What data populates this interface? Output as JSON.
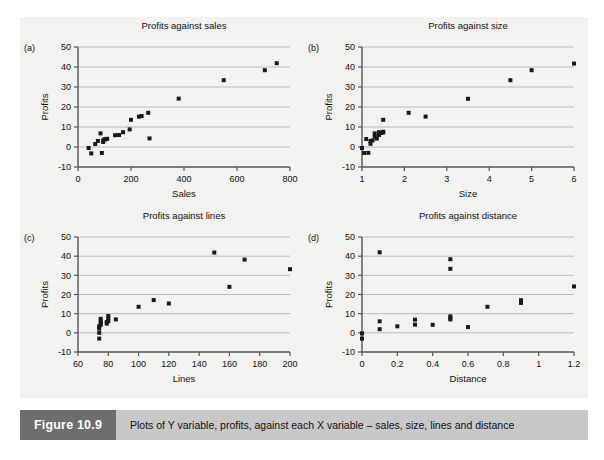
{
  "figure": {
    "caption_tag": "Figure 10.9",
    "caption_text": "Plots of Y variable, profits, against each X variable – sales, size, lines and distance",
    "panel_background": "#f2f2f0",
    "caption_bar_color": "#c8c8c8",
    "caption_tag_color": "#6e6e6e",
    "marker_color": "#1a1a1a",
    "axis_color": "#555555",
    "grid_color": "#b4b4b4"
  },
  "chart_data": [
    {
      "type": "scatter",
      "panel_label": "(a)",
      "title": "Profits against sales",
      "xlabel": "Sales",
      "ylabel": "Profits",
      "xlim": [
        0,
        800
      ],
      "ylim": [
        -10,
        50
      ],
      "xticks": [
        0,
        200,
        400,
        600,
        800
      ],
      "yticks": [
        -10,
        0,
        10,
        20,
        30,
        40,
        50
      ],
      "grid": "horizontal",
      "legend": "none",
      "x": [
        40,
        50,
        65,
        75,
        85,
        90,
        95,
        95,
        100,
        105,
        110,
        140,
        155,
        170,
        195,
        200,
        230,
        240,
        265,
        270,
        380,
        550,
        705,
        750
      ],
      "y": [
        -0.5,
        -3.2,
        1.5,
        3.0,
        6.8,
        -3.0,
        2.5,
        3.3,
        3.8,
        3.9,
        4.1,
        5.9,
        6.0,
        7.4,
        8.8,
        13.6,
        15.2,
        15.5,
        17.1,
        4.3,
        24.2,
        33.4,
        38.4,
        41.9
      ]
    },
    {
      "type": "scatter",
      "panel_label": "(b)",
      "title": "Profits against size",
      "xlabel": "Size",
      "ylabel": "Profits",
      "xlim": [
        1,
        6
      ],
      "ylim": [
        -10,
        50
      ],
      "xticks": [
        1,
        2,
        3,
        4,
        5,
        6
      ],
      "yticks": [
        -10,
        0,
        10,
        20,
        30,
        40,
        50
      ],
      "grid": "horizontal",
      "legend": "none",
      "x": [
        1.0,
        1.05,
        1.1,
        1.15,
        1.2,
        1.2,
        1.25,
        1.3,
        1.3,
        1.35,
        1.4,
        1.4,
        1.45,
        1.5,
        1.5,
        1.5,
        2.1,
        2.5,
        3.5,
        4.5,
        5.0,
        6.0
      ],
      "y": [
        -0.5,
        -3.0,
        4.0,
        -2.9,
        3.0,
        1.6,
        3.3,
        5.1,
        6.8,
        4.2,
        6.0,
        7.4,
        7.0,
        7.3,
        7.6,
        13.6,
        17.1,
        15.2,
        24.1,
        33.4,
        38.4,
        41.7
      ]
    },
    {
      "type": "scatter",
      "panel_label": "(c)",
      "title": "Profits against lines",
      "xlabel": "Lines",
      "ylabel": "Profits",
      "xlim": [
        60,
        200
      ],
      "ylim": [
        -10,
        50
      ],
      "xticks": [
        60,
        80,
        100,
        120,
        140,
        160,
        180,
        200
      ],
      "yticks": [
        -10,
        0,
        10,
        20,
        30,
        40,
        50
      ],
      "grid": "horizontal",
      "legend": "none",
      "x": [
        74,
        74,
        74,
        74,
        75,
        75,
        75,
        75,
        79,
        79,
        80,
        80,
        80,
        85,
        100,
        110,
        120,
        150,
        160,
        170,
        200
      ],
      "y": [
        -3.0,
        0.0,
        2.2,
        3.4,
        4.2,
        5.0,
        6.0,
        7.3,
        4.8,
        5.6,
        6.1,
        7.6,
        8.8,
        7.0,
        13.6,
        17.1,
        15.3,
        41.9,
        24.0,
        38.2,
        33.2
      ]
    },
    {
      "type": "scatter",
      "panel_label": "(d)",
      "title": "Profits against distance",
      "xlabel": "Distance",
      "ylabel": "Profits",
      "xlim": [
        0,
        1.2
      ],
      "ylim": [
        -10,
        50
      ],
      "xticks": [
        0,
        0.2,
        0.4,
        0.6,
        0.8,
        1,
        1.2
      ],
      "yticks": [
        -10,
        0,
        10,
        20,
        30,
        40,
        50
      ],
      "grid": "horizontal",
      "legend": "none",
      "x": [
        0.0,
        0.0,
        0.1,
        0.1,
        0.1,
        0.2,
        0.3,
        0.3,
        0.4,
        0.5,
        0.5,
        0.5,
        0.5,
        0.5,
        0.6,
        0.71,
        0.9,
        0.9,
        1.2
      ],
      "y": [
        -0.3,
        -3.0,
        42.0,
        6.0,
        1.9,
        3.4,
        6.9,
        4.3,
        4.2,
        38.4,
        33.4,
        8.6,
        7.6,
        7.0,
        3.0,
        13.6,
        17.0,
        15.6,
        24.2
      ]
    }
  ]
}
